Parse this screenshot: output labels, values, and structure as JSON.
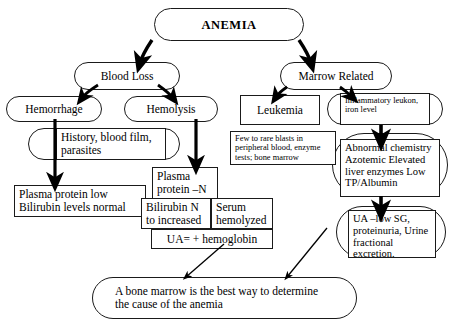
{
  "diagram": {
    "root": {
      "label": "ANEMIA"
    },
    "branches": {
      "left": {
        "label": "Blood Loss"
      },
      "right": {
        "label": "Marrow Related"
      }
    },
    "nodes": {
      "hemorrhage": {
        "label": "Hemorrhage"
      },
      "hemolysis": {
        "label": "Hemolysis"
      },
      "history": {
        "label": "History, blood film, parasites"
      },
      "plasma_protein_low": {
        "label": "Plasma protein low\nBilirubin levels normal"
      },
      "plasma_protein_n": {
        "label": "Plasma\nprotein –N"
      },
      "bilirubin": {
        "label": "Bilirubin  N\nto increased"
      },
      "serum_hemolyzed": {
        "label": "Serum\nhemolyzed"
      },
      "ua_hemoglobin": {
        "label": "UA= + hemoglobin"
      },
      "leukemia": {
        "label": "Leukemia"
      },
      "blasts": {
        "label": "Few to rare blasts in peripheral blood, enzyme tests; bone marrow"
      },
      "inflammatory": {
        "label": "Inflammatory leukon, iron level"
      },
      "abnormal_chemistry": {
        "label": "Abnormal chemistry\nAzotemic\nElevated liver\nenzymes\nLow TP/Albumin"
      },
      "urinalysis": {
        "label": "UA –low SG,\nproteinuria,\nUrine fractional\nexcretion."
      },
      "conclusion": {
        "label": "A bone marrow is the best way to determine the cause of the anemia"
      }
    },
    "colors": {
      "stroke": "#1a1a1a",
      "arrow": "#000000",
      "background": "#ffffff",
      "text": "#000000"
    }
  }
}
